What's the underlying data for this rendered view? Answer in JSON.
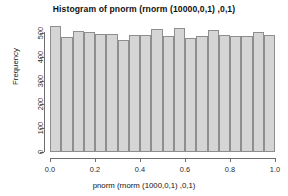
{
  "chart_data": {
    "type": "bar",
    "title": "Histogram of pnorm (rnorm (10000,0,1) ,0,1)",
    "xlabel": "pnorm (rnorm (1000,0,1) ,0,1)",
    "ylabel": "Frequency",
    "xlim": [
      0,
      1
    ],
    "ylim": [
      0,
      530
    ],
    "grid": false,
    "legend": null,
    "bin_width": 0.05,
    "bin_edges": [
      0.0,
      0.05,
      0.1,
      0.15,
      0.2,
      0.25,
      0.3,
      0.35,
      0.4,
      0.45,
      0.5,
      0.55,
      0.6,
      0.65,
      0.7,
      0.75,
      0.8,
      0.85,
      0.9,
      0.95,
      1.0
    ],
    "categories": [
      "0.00-0.05",
      "0.05-0.10",
      "0.10-0.15",
      "0.15-0.20",
      "0.20-0.25",
      "0.25-0.30",
      "0.30-0.35",
      "0.35-0.40",
      "0.40-0.45",
      "0.45-0.50",
      "0.50-0.55",
      "0.55-0.60",
      "0.60-0.65",
      "0.65-0.70",
      "0.70-0.75",
      "0.75-0.80",
      "0.80-0.85",
      "0.85-0.90",
      "0.90-0.95",
      "0.95-1.00"
    ],
    "values": [
      530,
      483,
      508,
      505,
      498,
      495,
      472,
      494,
      493,
      518,
      489,
      521,
      481,
      488,
      512,
      493,
      490,
      490,
      506,
      493
    ],
    "xticks": [
      0.0,
      0.2,
      0.4,
      0.6,
      0.8,
      1.0
    ],
    "xtick_labels": [
      "0.0",
      "0.2",
      "0.4",
      "0.6",
      "0.8",
      "1.0"
    ],
    "yticks": [
      0,
      100,
      200,
      300,
      400,
      500
    ],
    "ytick_labels": [
      "0",
      "100",
      "200",
      "300",
      "400",
      "500"
    ],
    "bar_fill_color": "#d5d5d5",
    "bar_border_color": "#8e8e8e",
    "axis_color": "#6e6e6e",
    "background_color": "#ffffff"
  }
}
